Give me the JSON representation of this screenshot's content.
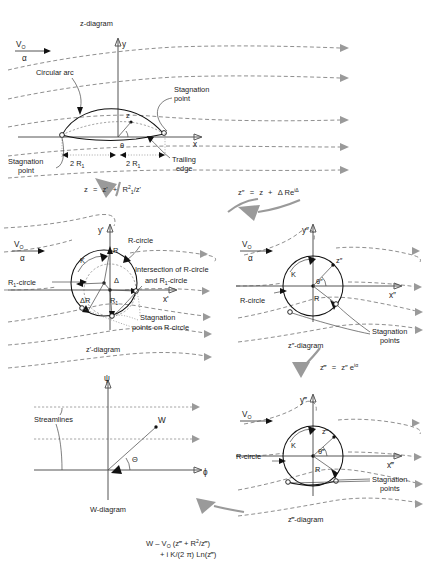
{
  "figure": {
    "background": "#ffffff",
    "ink": "#1a1a1a",
    "arrow_gray": "#9a9a9a"
  },
  "diagrams": {
    "z": {
      "caption": "z-diagram",
      "axis_x": "x",
      "axis_y": "y",
      "freestream_velocity": "V",
      "freestream_velocity_sub": "O",
      "angle_of_attack": "α",
      "labels": {
        "circular_arc": "Circular arc",
        "stagnation_point_right": "Stagnation\npoint",
        "stagnation_point_left": "Stagnation\npoint",
        "trailing_edge": "Trailing\nedge",
        "point_z": "z",
        "theta": "θ",
        "chord_left": "2 R",
        "chord_left_sub": "1",
        "chord_right": "2 R",
        "chord_right_sub": "1"
      }
    },
    "zprime": {
      "caption": "z'-diagram",
      "axis_x": "x'",
      "axis_y": "y'",
      "freestream_velocity": "V",
      "freestream_velocity_sub": "O",
      "angle_of_attack": "α",
      "labels": {
        "r_circle": "R-circle",
        "r1_circle": "R",
        "r1_circle_sub": "1",
        "r1_circle_tail": "-circle",
        "circulation": "K",
        "radius_R": "R",
        "radius_R1": "R",
        "radius_R1_sub": "1",
        "delta": "Δ",
        "delta_R": "ΔR",
        "intersection_line1": "Intersection of R-circle",
        "intersection_line2": "and R",
        "intersection_line2_sub": "1",
        "intersection_line2_tail": "-circle",
        "stagnation_line1": "Stagnation",
        "stagnation_line2": "points on R-circle"
      }
    },
    "zdoubleprime": {
      "caption": "z″-diagram",
      "axis_x": "x″",
      "axis_y": "y″",
      "freestream_velocity": "V",
      "freestream_velocity_sub": "O",
      "angle_of_attack": "α",
      "labels": {
        "r_circle": "R-circle",
        "circulation": "K",
        "radius_R": "R",
        "theta": "θ″",
        "point_z": "z″",
        "stagnation_line1": "Stagnation",
        "stagnation_line2": "points"
      }
    },
    "ztripleprime": {
      "caption": "z‴-diagram",
      "axis_x": "x‴",
      "axis_y": "y‴",
      "freestream_velocity": "V",
      "freestream_velocity_sub": "O",
      "labels": {
        "r_circle": "R-circle",
        "circulation": "K",
        "radius_R": "R",
        "theta": "θ‴",
        "point_z": "z‴",
        "stagnation_line1": "Stagnation",
        "stagnation_line2": "points"
      }
    },
    "w": {
      "caption": "W-diagram",
      "axis_x": "ϕ",
      "axis_y": "ψ",
      "labels": {
        "streamlines": "Streamlines",
        "point_W": "W",
        "theta": "Θ"
      }
    }
  },
  "equations": {
    "eq1": {
      "lhs": "z",
      "eq": "=",
      "rhs_a": "z'",
      "plus": "+",
      "rhs_b": "R",
      "rhs_b_sub": "1",
      "rhs_b_sup": "2",
      "rhs_b_den": "/z'"
    },
    "eq2": {
      "lhs": "z″",
      "eq": "=",
      "rhs_a": "z",
      "plus": "+",
      "rhs_b": "Δ Re",
      "rhs_b_sup": "iΔ"
    },
    "eq3": {
      "lhs": "z‴",
      "eq": "=",
      "rhs_a": "z″",
      "rhs_b": " e",
      "rhs_b_sup": "iα"
    },
    "complex_potential": {
      "line1_a": "W – V",
      "line1_sub": "O",
      "line1_b": " (z‴ + R",
      "line1_sup": "2",
      "line1_c": "/z‴)",
      "line2_a": "+ i K/(2 π) Ln(z‴)"
    }
  }
}
